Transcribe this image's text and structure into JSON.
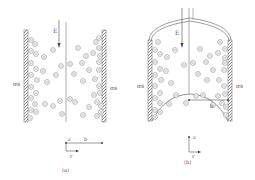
{
  "figure": {
    "panels": [
      {
        "id": "a",
        "caption": "(a)",
        "field_label": "E",
        "left_charge_label": "σs",
        "right_charge_label": "σs",
        "radius_label": "b",
        "axis_z_label": "z",
        "axis_r_label": "r",
        "top_shape": "open",
        "bottom_shape": "open"
      },
      {
        "id": "b",
        "caption": "(b)",
        "field_label": "E",
        "left_charge_label": "σs",
        "right_charge_label": "σs",
        "radius_label": "b",
        "axis_z_label": "z",
        "axis_r_label": "r",
        "top_shape": "dome",
        "bottom_shape": "concave-meniscus"
      }
    ],
    "ion_glyph": "⊖",
    "colors": {
      "stroke": "#777777",
      "text": "#555555",
      "background": "#ffffff"
    }
  }
}
